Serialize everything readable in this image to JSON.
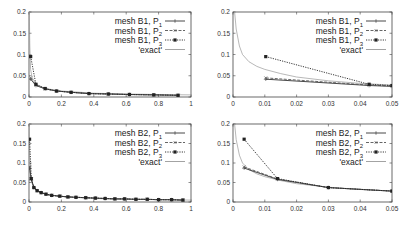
{
  "chart_data": [
    {
      "type": "line",
      "panel": "top-left",
      "xlim": [
        0,
        1
      ],
      "ylim": [
        0,
        0.2
      ],
      "xticks": [
        "0",
        "0.2",
        "0.4",
        "0.6",
        "0.8",
        "1"
      ],
      "yticks": [
        "0",
        "0.05",
        "0.1",
        "0.15",
        "0.2"
      ],
      "legend": [
        "mesh B1, P1",
        "mesh B1, P2",
        "mesh B1, P3",
        "'exact'"
      ],
      "series": [
        {
          "name": "mesh B1, P1",
          "x": [
            0.0103,
            0.0428,
            0.1,
            0.17,
            0.26,
            0.37,
            0.49,
            0.62,
            0.77,
            0.92
          ],
          "y": [
            0.042,
            0.027,
            0.019,
            0.014,
            0.011,
            0.008,
            0.007,
            0.006,
            0.005,
            0.004
          ]
        },
        {
          "name": "mesh B1, P2",
          "x": [
            0.0103,
            0.0428,
            0.1,
            0.17,
            0.26,
            0.37,
            0.49,
            0.62,
            0.77,
            0.92
          ],
          "y": [
            0.045,
            0.028,
            0.019,
            0.014,
            0.011,
            0.008,
            0.007,
            0.006,
            0.005,
            0.004
          ]
        },
        {
          "name": "mesh B1, P3",
          "x": [
            0.0103,
            0.0428,
            0.1,
            0.17,
            0.26,
            0.37,
            0.49,
            0.62,
            0.77,
            0.92
          ],
          "y": [
            0.095,
            0.03,
            0.02,
            0.014,
            0.011,
            0.008,
            0.007,
            0.006,
            0.005,
            0.004
          ]
        },
        {
          "name": "'exact'",
          "x": [
            0.002,
            0.005,
            0.01,
            0.02,
            0.05,
            0.1,
            0.2,
            0.4,
            0.6,
            0.8,
            1.0
          ],
          "y": [
            0.2,
            0.12,
            0.065,
            0.045,
            0.029,
            0.02,
            0.014,
            0.009,
            0.007,
            0.006,
            0.005
          ]
        }
      ]
    },
    {
      "type": "line",
      "panel": "top-right",
      "xlim": [
        0,
        0.05
      ],
      "ylim": [
        0,
        0.2
      ],
      "xticks": [
        "0",
        "0.01",
        "0.02",
        "0.03",
        "0.04",
        "0.05"
      ],
      "yticks": [
        "0",
        "0.05",
        "0.1",
        "0.15",
        "0.2"
      ],
      "legend": [
        "mesh B1, P1",
        "mesh B1, P2",
        "mesh B1, P3",
        "'exact'"
      ],
      "series": [
        {
          "name": "mesh B1, P1",
          "x": [
            0.0103,
            0.0428,
            0.05
          ],
          "y": [
            0.042,
            0.027,
            0.025
          ]
        },
        {
          "name": "mesh B1, P2",
          "x": [
            0.0103,
            0.0428,
            0.05
          ],
          "y": [
            0.045,
            0.028,
            0.026
          ]
        },
        {
          "name": "mesh B1, P3",
          "x": [
            0.0103,
            0.0428,
            0.05
          ],
          "y": [
            0.095,
            0.03,
            0.027
          ]
        },
        {
          "name": "'exact'",
          "x": [
            0.0005,
            0.001,
            0.002,
            0.003,
            0.005,
            0.0075,
            0.01,
            0.015,
            0.02,
            0.03,
            0.04,
            0.05
          ],
          "y": [
            0.2,
            0.16,
            0.12,
            0.1,
            0.083,
            0.072,
            0.065,
            0.055,
            0.047,
            0.038,
            0.032,
            0.028
          ]
        }
      ]
    },
    {
      "type": "line",
      "panel": "bottom-left",
      "xlim": [
        0,
        1
      ],
      "ylim": [
        0,
        0.2
      ],
      "xticks": [
        "0",
        "0.2",
        "0.4",
        "0.6",
        "0.8",
        "1"
      ],
      "yticks": [
        "0",
        "0.05",
        "0.1",
        "0.15",
        "0.2"
      ],
      "legend": [
        "mesh B2, P1",
        "mesh B2, P2",
        "mesh B2, P3",
        "'exact'"
      ],
      "series": [
        {
          "name": "mesh B2, P1",
          "x": [
            0.0035,
            0.014,
            0.03,
            0.05,
            0.075,
            0.105,
            0.14,
            0.19,
            0.24,
            0.29,
            0.35,
            0.41,
            0.47,
            0.53,
            0.59,
            0.66,
            0.73,
            0.8,
            0.88,
            0.95
          ],
          "y": [
            0.087,
            0.058,
            0.037,
            0.029,
            0.024,
            0.02,
            0.017,
            0.015,
            0.013,
            0.012,
            0.011,
            0.01,
            0.009,
            0.008,
            0.008,
            0.007,
            0.007,
            0.006,
            0.006,
            0.005
          ]
        },
        {
          "name": "mesh B2, P2",
          "x": [
            0.0035,
            0.014,
            0.03,
            0.05,
            0.075,
            0.105,
            0.14,
            0.19,
            0.24,
            0.29,
            0.35,
            0.41,
            0.47,
            0.53,
            0.59,
            0.66,
            0.73,
            0.8,
            0.88,
            0.95
          ],
          "y": [
            0.09,
            0.059,
            0.037,
            0.029,
            0.024,
            0.02,
            0.017,
            0.015,
            0.013,
            0.012,
            0.011,
            0.01,
            0.009,
            0.008,
            0.008,
            0.007,
            0.007,
            0.006,
            0.006,
            0.005
          ]
        },
        {
          "name": "mesh B2, P3",
          "x": [
            0.0035,
            0.014,
            0.03,
            0.05,
            0.075,
            0.105,
            0.14,
            0.19,
            0.24,
            0.29,
            0.35,
            0.41,
            0.47,
            0.53,
            0.59,
            0.66,
            0.73,
            0.8,
            0.88,
            0.95
          ],
          "y": [
            0.161,
            0.06,
            0.037,
            0.029,
            0.024,
            0.02,
            0.017,
            0.015,
            0.013,
            0.012,
            0.011,
            0.01,
            0.009,
            0.008,
            0.008,
            0.007,
            0.007,
            0.006,
            0.006,
            0.005
          ]
        },
        {
          "name": "'exact'",
          "x": [
            0.001,
            0.003,
            0.01,
            0.02,
            0.05,
            0.1,
            0.2,
            0.4,
            0.6,
            0.8,
            1.0
          ],
          "y": [
            0.2,
            0.11,
            0.065,
            0.047,
            0.029,
            0.02,
            0.014,
            0.009,
            0.007,
            0.006,
            0.005
          ]
        }
      ]
    },
    {
      "type": "line",
      "panel": "bottom-right",
      "xlim": [
        0,
        0.05
      ],
      "ylim": [
        0,
        0.2
      ],
      "xticks": [
        "0",
        "0.01",
        "0.02",
        "0.03",
        "0.04",
        "0.05"
      ],
      "yticks": [
        "0",
        "0.05",
        "0.1",
        "0.15",
        "0.2"
      ],
      "legend": [
        "mesh B2, P1",
        "mesh B2, P2",
        "mesh B2, P3",
        "'exact'"
      ],
      "series": [
        {
          "name": "mesh B2, P1",
          "x": [
            0.0035,
            0.014,
            0.03,
            0.05
          ],
          "y": [
            0.087,
            0.058,
            0.037,
            0.028
          ]
        },
        {
          "name": "mesh B2, P2",
          "x": [
            0.0035,
            0.014,
            0.03,
            0.05
          ],
          "y": [
            0.09,
            0.059,
            0.037,
            0.028
          ]
        },
        {
          "name": "mesh B2, P3",
          "x": [
            0.0035,
            0.014,
            0.03,
            0.05
          ],
          "y": [
            0.161,
            0.06,
            0.037,
            0.028
          ]
        },
        {
          "name": "'exact'",
          "x": [
            0.0005,
            0.001,
            0.002,
            0.003,
            0.005,
            0.0075,
            0.01,
            0.015,
            0.02,
            0.03,
            0.04,
            0.05
          ],
          "y": [
            0.2,
            0.16,
            0.12,
            0.1,
            0.083,
            0.072,
            0.065,
            0.055,
            0.047,
            0.038,
            0.032,
            0.028
          ]
        }
      ]
    }
  ],
  "panels": [
    {
      "frame": [
        29,
        12,
        191,
        97
      ]
    },
    {
      "frame": [
        233,
        12,
        392,
        97
      ]
    },
    {
      "frame": [
        29,
        124,
        191,
        202
      ]
    },
    {
      "frame": [
        233,
        124,
        392,
        202
      ]
    }
  ],
  "legend_labels": {
    "b1": [
      "mesh B1, P",
      "mesh B1, P",
      "mesh B1, P",
      "'exact'"
    ],
    "b2": [
      "mesh B2, P",
      "mesh B2, P",
      "mesh B2, P",
      "'exact'"
    ],
    "subs": [
      "1",
      "2",
      "3"
    ]
  }
}
